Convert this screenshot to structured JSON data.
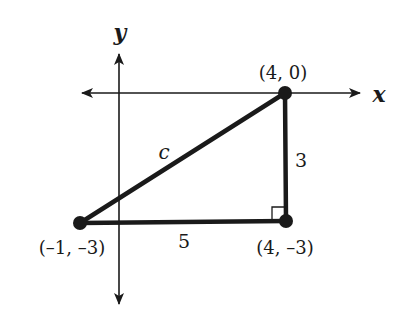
{
  "diagram": {
    "type": "coordinate-plane-right-triangle",
    "axes": {
      "x_label": "x",
      "y_label": "y"
    },
    "points": [
      {
        "id": "A",
        "label": "(4, 0)",
        "x": 4,
        "y": 0
      },
      {
        "id": "B",
        "label": "(4, –3)",
        "x": 4,
        "y": -3
      },
      {
        "id": "C",
        "label": "(–1, –3)",
        "x": -1,
        "y": -3
      }
    ],
    "sides": [
      {
        "from": "C",
        "to": "A",
        "label": "c"
      },
      {
        "from": "A",
        "to": "B",
        "label": "3"
      },
      {
        "from": "C",
        "to": "B",
        "label": "5"
      }
    ],
    "right_angle_at": "B",
    "colors": {
      "ink": "#1a1a1a",
      "background": "#ffffff"
    }
  }
}
